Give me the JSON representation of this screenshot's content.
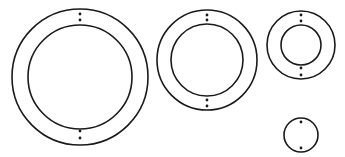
{
  "canvas": {
    "width": 345,
    "height": 157,
    "background": "#ffffff"
  },
  "style": {
    "stroke": "#1a1a1a",
    "stroke_width": 1.6,
    "dot_color": "#1a1a1a",
    "dot_radius": 1.4
  },
  "figures": [
    {
      "name": "ring-large",
      "cx": 80,
      "cy": 77,
      "outer_r": 68,
      "inner_r": 52,
      "dots": [
        [
          80,
          14
        ],
        [
          80,
          20
        ],
        [
          80,
          131
        ],
        [
          80,
          138
        ]
      ]
    },
    {
      "name": "ring-medium",
      "cx": 207,
      "cy": 60,
      "outer_r": 50,
      "inner_r": 36,
      "dots": [
        [
          207,
          15
        ],
        [
          207,
          20
        ],
        [
          207,
          100
        ],
        [
          207,
          106
        ]
      ]
    },
    {
      "name": "ring-small",
      "cx": 301,
      "cy": 45,
      "outer_r": 34,
      "inner_r": 20,
      "dots": [
        [
          301,
          15
        ],
        [
          301,
          21
        ],
        [
          301,
          68
        ],
        [
          301,
          75
        ]
      ]
    },
    {
      "name": "disc-tiny",
      "cx": 301,
      "cy": 135,
      "outer_r": 17,
      "inner_r": null,
      "dots": [
        [
          301,
          122
        ],
        [
          301,
          148
        ]
      ]
    }
  ]
}
